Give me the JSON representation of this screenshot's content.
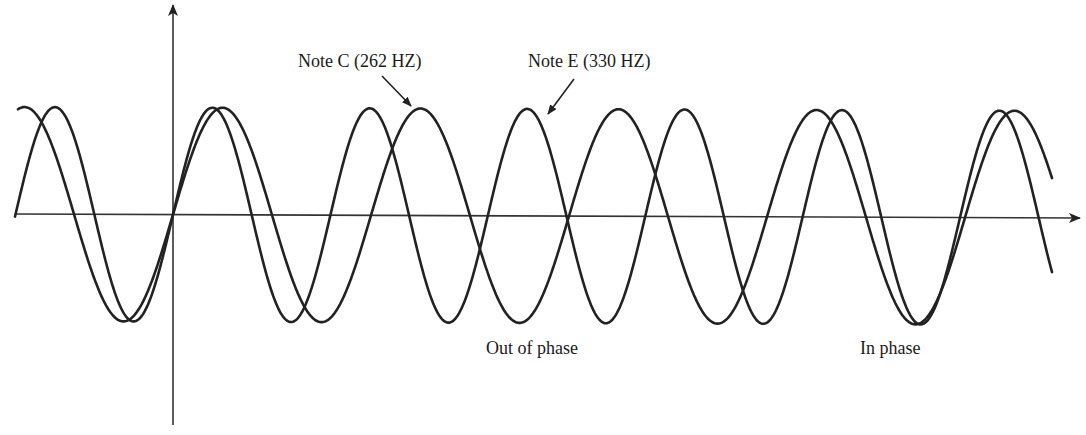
{
  "chart_data": {
    "type": "line",
    "title": "",
    "xlabel": "",
    "ylabel": "",
    "grid": false,
    "legend": null,
    "axes": {
      "origin_px": [
        173,
        214
      ],
      "x_axis": {
        "from_px": [
          16,
          214
        ],
        "to_px": [
          1080,
          218
        ],
        "arrow": true
      },
      "y_axis": {
        "from_px": [
          173,
          425
        ],
        "to_px": [
          173,
          5
        ],
        "arrow": true
      }
    },
    "x_range_px": [
      16,
      1052
    ],
    "amplitude_px": 107,
    "series": [
      {
        "name": "Note C (262 HZ)",
        "frequency_hz": 262,
        "half_period_px": 99,
        "phase_zero_px": 173,
        "stroke": "#222222"
      },
      {
        "name": "Note E (330 HZ)",
        "frequency_hz": 330,
        "half_period_px": 78.7,
        "phase_zero_px": 173,
        "stroke": "#222222"
      }
    ],
    "annotations": [
      {
        "text": "Note C (262 HZ)",
        "x": 298,
        "y": 52,
        "arrow_from": [
          382,
          76
        ],
        "arrow_to": [
          411,
          106
        ]
      },
      {
        "text": "Note E (330 HZ)",
        "x": 528,
        "y": 52,
        "arrow_from": [
          574,
          79
        ],
        "arrow_to": [
          548,
          114
        ]
      },
      {
        "text": "Out of phase",
        "x": 486,
        "y": 339
      },
      {
        "text": "In phase",
        "x": 860,
        "y": 339
      }
    ]
  },
  "labels": {
    "note_c": "Note C (262 HZ)",
    "note_e": "Note E (330 HZ)",
    "out_of_phase": "Out of phase",
    "in_phase": "In phase"
  },
  "colors": {
    "ink": "#222222",
    "background": "#ffffff"
  }
}
